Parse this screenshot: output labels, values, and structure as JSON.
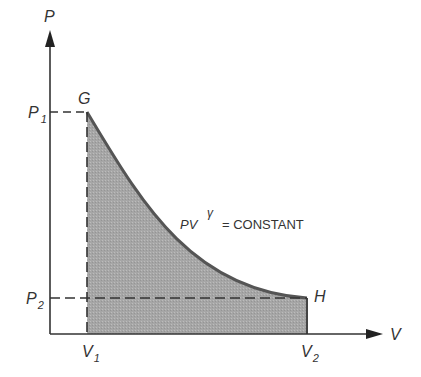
{
  "diagram": {
    "axes": {
      "y_label": "P",
      "x_label": "V"
    },
    "points": {
      "G": {
        "label": "G"
      },
      "H": {
        "label": "H"
      }
    },
    "ticks": {
      "P1": {
        "main": "P",
        "sub": "1"
      },
      "P2": {
        "main": "P",
        "sub": "2"
      },
      "V1": {
        "main": "V",
        "sub": "1"
      },
      "V2": {
        "main": "V",
        "sub": "2"
      }
    },
    "equation": {
      "base": "PV",
      "exponent": "γ",
      "rest": "= CONSTANT"
    },
    "colors": {
      "fill": "#a9a9a9",
      "curve": "#555555",
      "axis": "#333333"
    }
  }
}
